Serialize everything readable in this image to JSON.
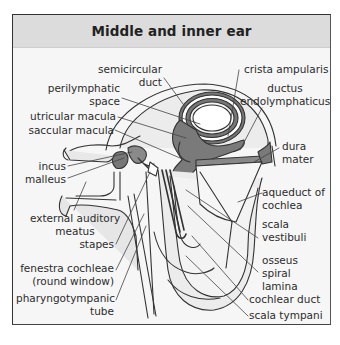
{
  "title": "Middle and inner ear",
  "colors": {
    "background": "#f6f6f6",
    "header": "#dcdcdc",
    "endolymph_fill": "#7a7a7a",
    "bone_fill": "#e4e4e4",
    "outline": "#333333"
  },
  "labels": {
    "semicircular_duct": [
      "semicircular",
      "duct"
    ],
    "perilymphatic_space": [
      "perilymphatic",
      "space"
    ],
    "utricular_macula": "utricular macula",
    "saccular_macula": "saccular macula",
    "incus": "incus",
    "malleus": "malleus",
    "external_auditory_meatus": [
      "external auditory",
      "meatus"
    ],
    "stapes": "stapes",
    "fenestra_cochleae": [
      "fenestra cochleae",
      "(round window)"
    ],
    "pharyngotympanic_tube": [
      "pharyngotympanic",
      "tube"
    ],
    "crista_ampularis": "crista ampularis",
    "ductus_endolymphaticus": [
      "ductus",
      "endolymphaticus"
    ],
    "dura_mater": [
      "dura",
      "mater"
    ],
    "aqueduct_of_cochlea": [
      "aqueduct of",
      "cochlea"
    ],
    "scala_vestibuli": [
      "scala",
      "vestibuli"
    ],
    "osseus_spiral_lamina": [
      "osseus",
      "spiral",
      "lamina"
    ],
    "cochlear_duct": "cochlear duct",
    "scala_tympani": "scala tympani"
  }
}
